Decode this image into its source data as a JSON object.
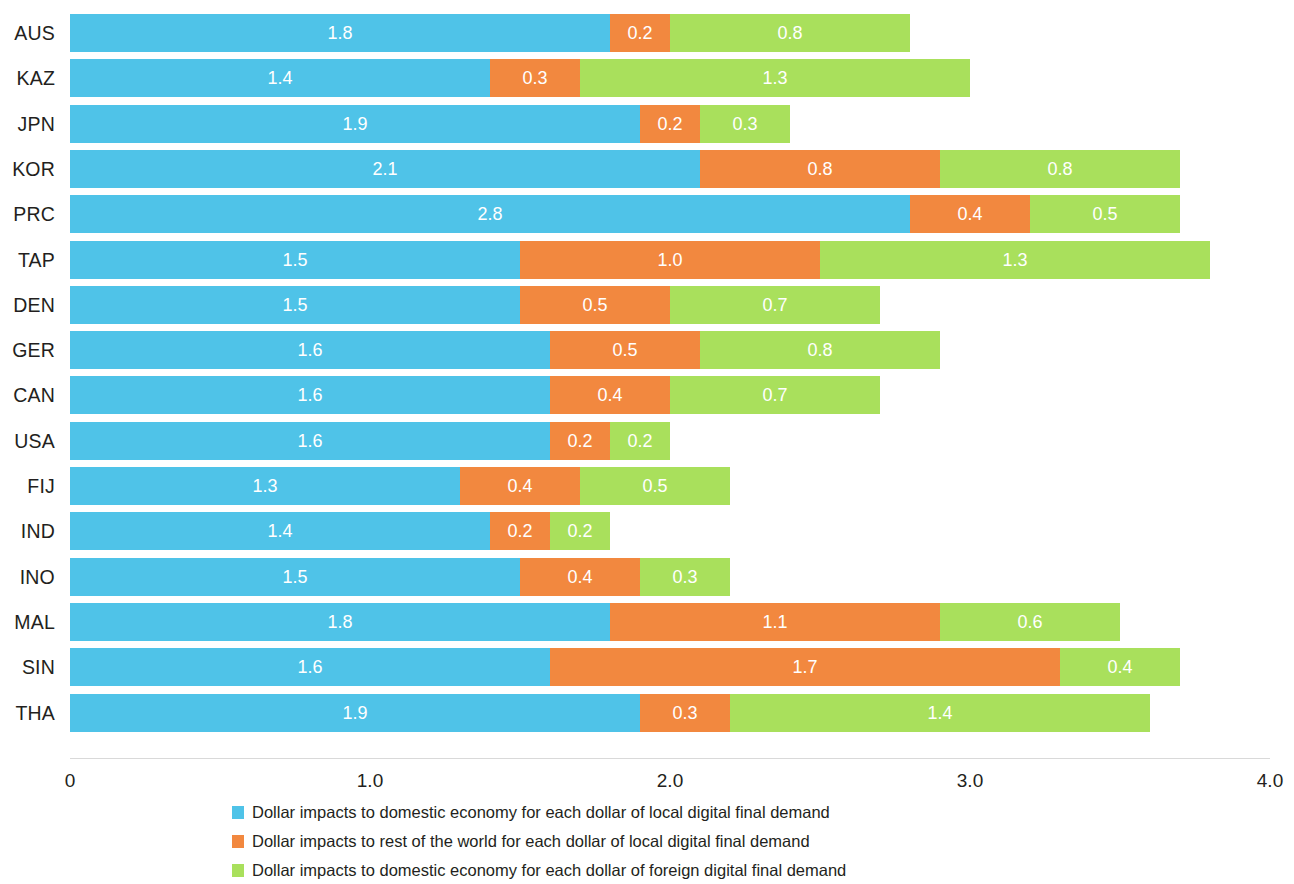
{
  "chart_data": {
    "type": "bar",
    "orientation": "horizontal",
    "stacked": true,
    "title": "",
    "subtitle": "",
    "xlabel": "",
    "ylabel": "",
    "xlim": [
      0,
      4.0
    ],
    "grid": false,
    "legend_position": "bottom",
    "xticks": [
      "0",
      "1.0",
      "2.0",
      "3.0",
      "4.0"
    ],
    "xtick_values": [
      0,
      1.0,
      2.0,
      3.0,
      4.0
    ],
    "categories": [
      "AUS",
      "KAZ",
      "JPN",
      "KOR",
      "PRC",
      "TAP",
      "DEN",
      "GER",
      "CAN",
      "USA",
      "FIJ",
      "IND",
      "INO",
      "MAL",
      "SIN",
      "THA"
    ],
    "series": [
      {
        "name": "Dollar impacts to domestic economy for each dollar of local digital final demand",
        "color": "#4FC3E8",
        "values": [
          1.8,
          1.4,
          1.9,
          2.1,
          2.8,
          1.5,
          1.5,
          1.6,
          1.6,
          1.6,
          1.3,
          1.4,
          1.5,
          1.8,
          1.6,
          1.9
        ]
      },
      {
        "name": "Dollar impacts to rest of the world for each dollar of local digital final demand",
        "color": "#F2883F",
        "values": [
          0.2,
          0.3,
          0.2,
          0.8,
          0.4,
          1.0,
          0.5,
          0.5,
          0.4,
          0.2,
          0.4,
          0.2,
          0.4,
          1.1,
          1.7,
          0.3
        ]
      },
      {
        "name": "Dollar impacts to domestic economy for each dollar of foreign digital final demand",
        "color": "#A9E05C",
        "values": [
          0.8,
          1.3,
          0.3,
          0.8,
          0.5,
          1.3,
          0.7,
          0.8,
          0.7,
          0.2,
          0.5,
          0.2,
          0.3,
          0.6,
          0.4,
          1.4
        ]
      }
    ],
    "bar_labels": [
      [
        "1.8",
        "0.2",
        "0.8"
      ],
      [
        "1.4",
        "0.3",
        "1.3"
      ],
      [
        "1.9",
        "0.2",
        "0.3"
      ],
      [
        "2.1",
        "0.8",
        "0.8"
      ],
      [
        "2.8",
        "0.4",
        "0.5"
      ],
      [
        "1.5",
        "1.0",
        "1.3"
      ],
      [
        "1.5",
        "0.5",
        "0.7"
      ],
      [
        "1.6",
        "0.5",
        "0.8"
      ],
      [
        "1.6",
        "0.4",
        "0.7"
      ],
      [
        "1.6",
        "0.2",
        "0.2"
      ],
      [
        "1.3",
        "0.4",
        "0.5"
      ],
      [
        "1.4",
        "0.2",
        "0.2"
      ],
      [
        "1.5",
        "0.4",
        "0.3"
      ],
      [
        "1.8",
        "1.1",
        "0.6"
      ],
      [
        "1.6",
        "1.7",
        "0.4"
      ],
      [
        "1.9",
        "0.3",
        "1.4"
      ]
    ]
  },
  "legend": {
    "items": [
      {
        "label": "Dollar impacts to domestic economy for each dollar of local digital final demand",
        "color": "#4FC3E8"
      },
      {
        "label": "Dollar impacts to rest of the world for each dollar of local digital final demand",
        "color": "#F2883F"
      },
      {
        "label": "Dollar impacts to domestic economy for each dollar of foreign digital final demand",
        "color": "#A9E05C"
      }
    ]
  },
  "layout": {
    "plot_left_px": 70,
    "plot_width_px": 1200,
    "row_pitch_px": 45.3,
    "row_top_px": 14,
    "bar_height_px": 38,
    "axis_top_px": 758
  }
}
